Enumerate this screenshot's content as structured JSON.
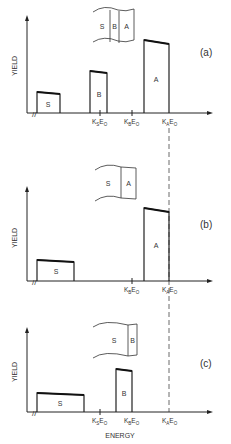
{
  "figure": {
    "x_axis_label": "ENERGY",
    "y_axis_label": "YIELD",
    "ink_color": "#222222",
    "panels": [
      {
        "id": "a",
        "panel_label": "(a)",
        "inset_layers": [
          "S",
          "B",
          "A"
        ],
        "blocks": [
          {
            "label": "S"
          },
          {
            "label": "B"
          },
          {
            "label": "A"
          }
        ],
        "ticks": [
          "KSEO",
          "KBEO",
          "KAEO"
        ]
      },
      {
        "id": "b",
        "panel_label": "(b)",
        "inset_layers": [
          "S",
          "A"
        ],
        "blocks": [
          {
            "label": "S"
          },
          {
            "label": "A"
          }
        ],
        "ticks": [
          "KBEO",
          "KAEO"
        ]
      },
      {
        "id": "c",
        "panel_label": "(c)",
        "inset_layers": [
          "S",
          "B"
        ],
        "blocks": [
          {
            "label": "S"
          },
          {
            "label": "B"
          }
        ],
        "ticks": [
          "KSEO",
          "KBEO",
          "KAEO"
        ]
      }
    ],
    "tick_parts": {
      "K": "K",
      "E": "E",
      "O": "O",
      "S": "S",
      "B": "B",
      "A": "A"
    }
  }
}
